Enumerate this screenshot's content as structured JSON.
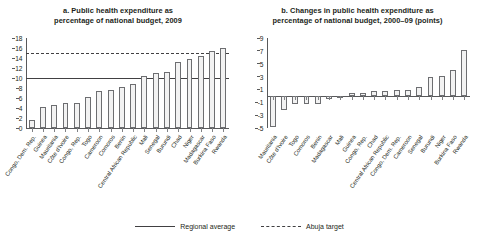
{
  "chart_data": [
    {
      "id": "a",
      "type": "bar",
      "title": "a. Public health expenditure as percentage of national budget, 2009",
      "title_lines": [
        "a. Public health expenditure as",
        "percentage of national budget, 2009"
      ],
      "xlabel": "",
      "ylabel": "",
      "ylim": [
        0,
        18
      ],
      "yticks": [
        0,
        2,
        4,
        6,
        8,
        10,
        12,
        14,
        16,
        18
      ],
      "grid": false,
      "categories": [
        "Congo, Dem. Rep.",
        "Guinea",
        "Mauritania",
        "Côte d'Ivoire",
        "Congo, Rep.",
        "Togo",
        "Cameroon",
        "Comoros",
        "Benin",
        "Central African Republic",
        "Mali",
        "Senegal",
        "Burundi",
        "Chad",
        "Niger",
        "Madagascar",
        "Burkina Faso",
        "Rwanda"
      ],
      "values": [
        1.7,
        4.2,
        4.7,
        5.0,
        5.1,
        6.2,
        7.5,
        7.7,
        8.2,
        8.9,
        10.5,
        11.1,
        11.3,
        13.2,
        13.9,
        14.4,
        15.5,
        16.1
      ],
      "reference_lines": [
        {
          "name": "Regional average",
          "value": 10.0,
          "style": "solid"
        },
        {
          "name": "Abuja target",
          "value": 15.0,
          "style": "dashed"
        }
      ]
    },
    {
      "id": "b",
      "type": "bar",
      "title": "b. Changes in public health expenditure as percentage of national budget, 2000–09 (points)",
      "title_lines": [
        "b. Changes in public health expenditure as",
        "percentage of national budget, 2000–09 (points)"
      ],
      "xlabel": "",
      "ylabel": "",
      "ylim": [
        -5,
        9
      ],
      "yticks": [
        -5,
        -3,
        -1,
        1,
        3,
        5,
        7,
        9
      ],
      "grid": false,
      "categories": [
        "Mauritania",
        "Côte d'Ivoire",
        "Togo",
        "Comoros",
        "Benin",
        "Madagascar",
        "Mali",
        "Guinea",
        "Congo, Rep.",
        "Chad",
        "Central African Republic",
        "Congo, Dem. Rep.",
        "Cameroon",
        "Senegal",
        "Burundi",
        "Niger",
        "Burkina Faso",
        "Rwanda"
      ],
      "values": [
        -4.8,
        -2.2,
        -1.3,
        -1.3,
        -1.3,
        -0.5,
        -0.4,
        0.4,
        0.5,
        0.7,
        0.7,
        0.9,
        0.9,
        1.4,
        3.0,
        3.1,
        4.1,
        7.2
      ],
      "reference_lines": []
    }
  ],
  "legend": {
    "position": "bottom-center",
    "items": [
      {
        "label": "Regional average",
        "style": "solid"
      },
      {
        "label": "Abuja target",
        "style": "dashed"
      }
    ]
  }
}
